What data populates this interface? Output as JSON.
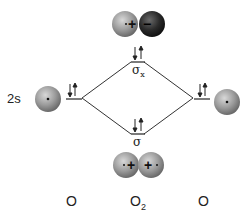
{
  "diagram": {
    "type": "molecular-orbital-diagram",
    "left_orbital_label": "2s",
    "antibonding_label": "σ",
    "antibonding_subscript": "x",
    "bonding_label": "σ",
    "bottom_labels": {
      "left": "O",
      "center": "O",
      "center_subscript": "2",
      "right": "O"
    },
    "antibonding_signs": {
      "left": "+",
      "right": "−"
    },
    "bonding_signs": {
      "left": "+",
      "right": "+"
    },
    "colors": {
      "line": "#333333",
      "sphere_light": "#9a9a9a",
      "sphere_dark": "#2a2a2a"
    }
  }
}
